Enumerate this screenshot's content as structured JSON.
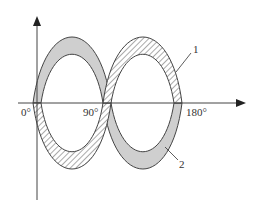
{
  "diagram": {
    "axes": {
      "x_ticks": [
        {
          "label": "0°",
          "x": 37
        },
        {
          "label": "90°",
          "x": 107
        },
        {
          "label": "180°",
          "x": 178
        }
      ]
    },
    "curves": [
      {
        "id": "1",
        "label": "1",
        "style": "hatched",
        "description": "wave band starting below axis at 0°, peaking near 135°"
      },
      {
        "id": "2",
        "label": "2",
        "style": "gray-filled",
        "description": "wave band starting above axis at 0°, peaking near 45°"
      }
    ],
    "colors": {
      "band_fill": "#cfcfcf",
      "outline": "#444444",
      "axis": "#444444",
      "background": "#ffffff"
    }
  }
}
